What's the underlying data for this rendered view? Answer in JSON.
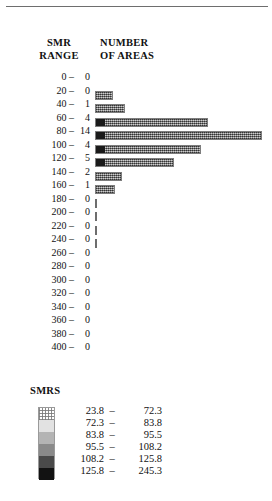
{
  "headers": {
    "smr_range_line1": "SMR",
    "smr_range_line2": "RANGE",
    "number_line1": "NUMBER",
    "number_line2": "OF AREAS"
  },
  "chart_data": {
    "type": "bar",
    "orientation": "horizontal",
    "title": "",
    "xlabel": "NUMBER OF AREAS",
    "ylabel": "SMR RANGE",
    "categories": [
      "0 –",
      "20 –",
      "40 –",
      "60 –",
      "80 –",
      "100 –",
      "120 –",
      "140 –",
      "160 –",
      "180 –",
      "200 –",
      "220 –",
      "240 –",
      "260 –",
      "280 –",
      "300 –",
      "320 –",
      "340 –",
      "360 –",
      "380 –",
      "400 –"
    ],
    "values": [
      0,
      0,
      1,
      4,
      14,
      4,
      5,
      2,
      1,
      0,
      0,
      0,
      0,
      0,
      0,
      0,
      0,
      0,
      0,
      0,
      0
    ],
    "bin_width": 20,
    "xlim": [
      0,
      14
    ],
    "grid": false,
    "legend_position": "below"
  },
  "rows": [
    {
      "label": "0 –",
      "count": "0",
      "bar_px": 0,
      "mark": "none"
    },
    {
      "label": "20 –",
      "count": "0",
      "bar_px": 18,
      "mark": "bar"
    },
    {
      "label": "40 –",
      "count": "1",
      "bar_px": 30,
      "mark": "bar"
    },
    {
      "label": "60 –",
      "count": "4",
      "bar_px": 113,
      "mark": "bar-cap"
    },
    {
      "label": "80 –",
      "count": "14",
      "bar_px": 167,
      "mark": "bar-cap"
    },
    {
      "label": "100 –",
      "count": "4",
      "bar_px": 106,
      "mark": "bar-cap"
    },
    {
      "label": "120 –",
      "count": "5",
      "bar_px": 79,
      "mark": "bar-cap"
    },
    {
      "label": "140 –",
      "count": "2",
      "bar_px": 27,
      "mark": "bar"
    },
    {
      "label": "160 –",
      "count": "1",
      "bar_px": 20,
      "mark": "bar"
    },
    {
      "label": "180 –",
      "count": "0",
      "bar_px": 2,
      "mark": "tick"
    },
    {
      "label": "200 –",
      "count": "0",
      "bar_px": 2,
      "mark": "tick"
    },
    {
      "label": "220 –",
      "count": "0",
      "bar_px": 2,
      "mark": "tick"
    },
    {
      "label": "240 –",
      "count": "0",
      "bar_px": 2,
      "mark": "tick"
    },
    {
      "label": "260 –",
      "count": "0",
      "bar_px": 0,
      "mark": "none"
    },
    {
      "label": "280 –",
      "count": "0",
      "bar_px": 0,
      "mark": "none"
    },
    {
      "label": "300 –",
      "count": "0",
      "bar_px": 0,
      "mark": "none"
    },
    {
      "label": "320 –",
      "count": "0",
      "bar_px": 0,
      "mark": "none"
    },
    {
      "label": "340 –",
      "count": "0",
      "bar_px": 0,
      "mark": "none"
    },
    {
      "label": "360 –",
      "count": "0",
      "bar_px": 0,
      "mark": "none"
    },
    {
      "label": "380 –",
      "count": "0",
      "bar_px": 0,
      "mark": "none"
    },
    {
      "label": "400 –",
      "count": "0",
      "bar_px": 0,
      "mark": "none"
    }
  ],
  "legend": {
    "title": "SMRS",
    "classes": [
      {
        "low": "23.8",
        "dash": "–",
        "high": "72.3",
        "color": "#ffffff",
        "stipple": true
      },
      {
        "low": "72.3",
        "dash": "–",
        "high": "83.8",
        "color": "#e2e2e2",
        "stipple": false
      },
      {
        "low": "83.8",
        "dash": "–",
        "high": "95.5",
        "color": "#b4b4b4",
        "stipple": false
      },
      {
        "low": "95.5",
        "dash": "–",
        "high": "108.2",
        "color": "#8a8a8a",
        "stipple": false
      },
      {
        "low": "108.2",
        "dash": "–",
        "high": "125.8",
        "color": "#4a4a4a",
        "stipple": false
      },
      {
        "low": "125.8",
        "dash": "–",
        "high": "245.3",
        "color": "#121212",
        "stipple": false
      }
    ]
  }
}
